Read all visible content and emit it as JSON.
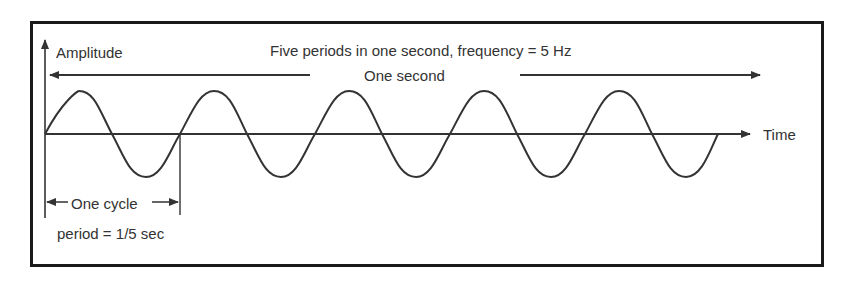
{
  "diagram": {
    "y_axis_label": "Amplitude",
    "x_axis_label": "Time",
    "title": "Five periods in one second, frequency = 5 Hz",
    "span_label": "One second",
    "cycle_label": "One cycle",
    "period_label": "period = 1/5 sec",
    "cycles": 5,
    "frequency_hz": 5,
    "colors": {
      "line": "#333333",
      "frame": "#1a1a1a",
      "background": "#ffffff"
    }
  }
}
